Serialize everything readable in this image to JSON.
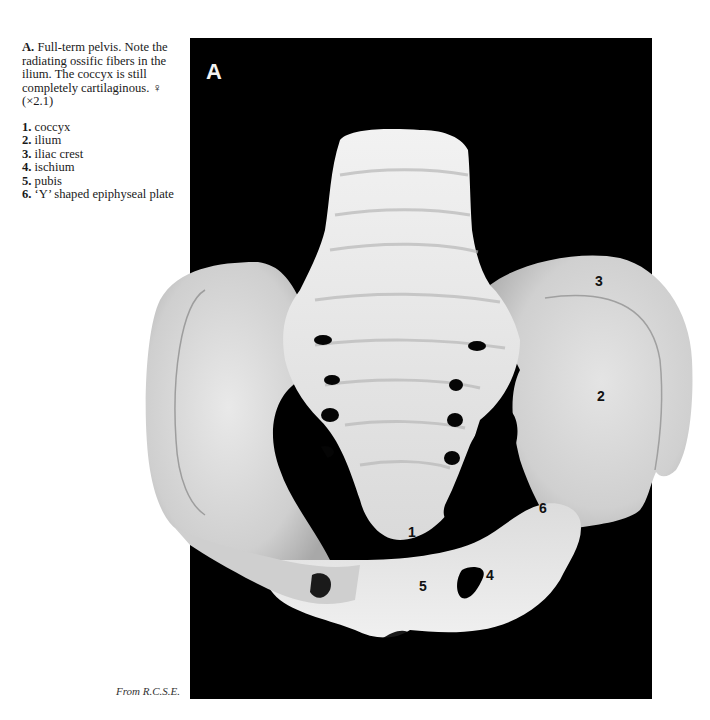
{
  "figure": {
    "panel_letter": "A",
    "caption": {
      "prefix": "A.",
      "text": "Full-term pelvis. Note the radiating ossific fibers in the ilium. The coccyx is still completely cartilaginous. ♀ (×2.1)"
    },
    "legend": [
      {
        "num": "1.",
        "label": "coccyx"
      },
      {
        "num": "2.",
        "label": "ilium"
      },
      {
        "num": "3.",
        "label": "iliac crest"
      },
      {
        "num": "4.",
        "label": "ischium"
      },
      {
        "num": "5.",
        "label": "pubis"
      },
      {
        "num": "6.",
        "label": "‘Y’ shaped epiphyseal plate"
      }
    ],
    "labels": [
      {
        "num": "1",
        "x": 408,
        "y": 524
      },
      {
        "num": "2",
        "x": 597,
        "y": 388
      },
      {
        "num": "3",
        "x": 595,
        "y": 273
      },
      {
        "num": "4",
        "x": 486,
        "y": 567
      },
      {
        "num": "5",
        "x": 419,
        "y": 578
      },
      {
        "num": "6",
        "x": 539,
        "y": 500
      }
    ],
    "credit": "From R.C.S.E.",
    "colors": {
      "background": "#000000",
      "bone": "#e6e6e6",
      "text": "#1a1a1a"
    }
  }
}
